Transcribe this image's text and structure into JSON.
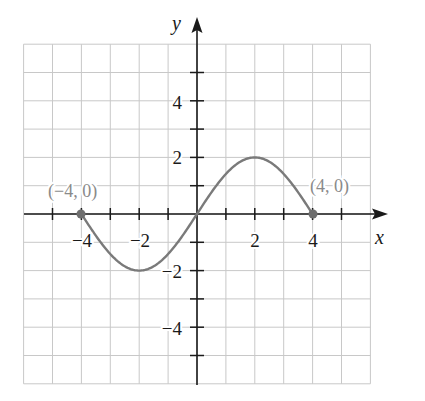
{
  "chart_data": {
    "type": "line",
    "title": "",
    "xlabel": "x",
    "ylabel": "y",
    "xlim": [
      -6,
      6
    ],
    "ylim": [
      -6,
      6
    ],
    "grid": true,
    "x_ticks": [
      -6,
      -5,
      -4,
      -3,
      -2,
      -1,
      1,
      2,
      3,
      4,
      5,
      6
    ],
    "x_tick_labels": [
      {
        "value": -4,
        "label": "−4"
      },
      {
        "value": -2,
        "label": "−2"
      },
      {
        "value": 2,
        "label": "2"
      },
      {
        "value": 4,
        "label": "4"
      }
    ],
    "y_ticks": [
      -5,
      -4,
      -3,
      -2,
      -1,
      1,
      2,
      3,
      4,
      5
    ],
    "y_tick_labels": [
      {
        "value": 4,
        "label": "4"
      },
      {
        "value": 2,
        "label": "2"
      },
      {
        "value": -2,
        "label": "−2"
      },
      {
        "value": -4,
        "label": "−4"
      }
    ],
    "series": [
      {
        "name": "curve",
        "description": "sine-like curve from (-4,0) through min (-2,-2), origin, max (2,2) to (4,0)",
        "x": [
          -4,
          -3,
          -2,
          -1,
          0,
          1,
          2,
          3,
          4
        ],
        "y": [
          0,
          -1.41,
          -2,
          -1.41,
          0,
          1.41,
          2,
          1.41,
          0
        ]
      }
    ],
    "annotations": [
      {
        "x": -4,
        "y": 0,
        "label": "(−4, 0)",
        "marker": "dot"
      },
      {
        "x": 4,
        "y": 0,
        "label": "(4, 0)",
        "marker": "dot"
      }
    ]
  },
  "colors": {
    "grid": "#c8c8c8",
    "axis": "#1a1a1a",
    "curve": "#7a7a7a",
    "point": "#6e6e6e",
    "point_label": "#8a8a8a",
    "tick_label": "#1a1a1a"
  },
  "labels": {
    "x_axis": "x",
    "y_axis": "y",
    "point_left": "(−4, 0)",
    "point_right": "(4, 0)",
    "tick_x_neg4": "−4",
    "tick_x_neg2": "−2",
    "tick_x_2": "2",
    "tick_x_4": "4",
    "tick_y_4": "4",
    "tick_y_2": "2",
    "tick_y_neg2": "−2",
    "tick_y_neg4": "−4"
  }
}
